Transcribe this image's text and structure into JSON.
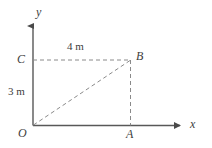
{
  "figure": {
    "background_color": "#ffffff",
    "stroke_color": "#555555",
    "dash_color": "#808080",
    "text_color": "#3d3d3d",
    "axes": {
      "x_axis_label": "x",
      "y_axis_label": "y",
      "origin_label": "O"
    },
    "points": [
      {
        "id": "O",
        "label": "O",
        "x_m": 0,
        "y_m": 0
      },
      {
        "id": "A",
        "label": "A",
        "x_m": 4,
        "y_m": 0
      },
      {
        "id": "B",
        "label": "B",
        "x_m": 4,
        "y_m": 3
      },
      {
        "id": "C",
        "label": "C",
        "x_m": 0,
        "y_m": 3
      }
    ],
    "dimensions": [
      {
        "id": "horizontal",
        "label": "4 m",
        "value": 4,
        "unit": "m",
        "from": "C",
        "to": "B"
      },
      {
        "id": "vertical",
        "label": "3 m",
        "value": 3,
        "unit": "m",
        "from": "O",
        "to": "C"
      }
    ],
    "segments": [
      {
        "id": "x-axis",
        "style": "solid",
        "arrow": true
      },
      {
        "id": "y-axis",
        "style": "solid",
        "arrow": true
      },
      {
        "id": "C-to-B",
        "style": "dashed",
        "arrow": false
      },
      {
        "id": "B-to-A",
        "style": "dashed",
        "arrow": false
      },
      {
        "id": "O-to-B",
        "style": "dashed",
        "arrow": false
      }
    ]
  }
}
